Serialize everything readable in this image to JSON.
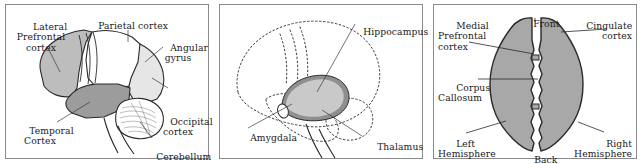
{
  "figure": {
    "panel_count": 3
  },
  "colors": {
    "background": "#ffffff",
    "frame_border": "#8a8a8a",
    "outline": "#1a1a1a",
    "text": "#1a1a1a",
    "fill_light": "#d8d8d8",
    "fill_medium": "#b9b9b9",
    "fill_dark": "#9a9a9a",
    "fill_pale": "#e6e6e6",
    "fill_white": "#ffffff",
    "hippocampus_band": "#8f8f8f",
    "hippocampus_fill": "#c9c9c9",
    "hemisphere_fill": "#a8a8a8"
  },
  "panels": [
    {
      "id": "lateral-view",
      "name": "Lateral brain view",
      "labels": [
        {
          "key": "lateral_prefrontal_cortex",
          "text": "Lateral\nPrefrontal\ncortex",
          "align": "center"
        },
        {
          "key": "parietal_cortex",
          "text": "Parietal cortex",
          "align": "center"
        },
        {
          "key": "angular_gyrus",
          "text": "Angular\ngyrus",
          "align": "center"
        },
        {
          "key": "temporal_cortex",
          "text": "Temporal\nCortex",
          "align": "center"
        },
        {
          "key": "occipital_cortex",
          "text": "Occipital\ncortex",
          "align": "center"
        },
        {
          "key": "cerebellum",
          "text": "Cerebellum",
          "align": "center"
        }
      ],
      "regions": [
        {
          "key": "lateral_prefrontal",
          "shade": "fill_medium"
        },
        {
          "key": "temporal",
          "shade": "fill_dark"
        },
        {
          "key": "occipital",
          "shade": "fill_pale"
        },
        {
          "key": "parietal",
          "shade": "fill_white"
        },
        {
          "key": "cerebellum",
          "shade": "fill_white"
        }
      ]
    },
    {
      "id": "limbic-view",
      "name": "Limbic structures view",
      "labels": [
        {
          "key": "hippocampus",
          "text": "Hippocampus",
          "align": "left"
        },
        {
          "key": "amygdala",
          "text": "Amygdala",
          "align": "left"
        },
        {
          "key": "thalamus",
          "text": "Thalamus",
          "align": "left"
        }
      ],
      "regions": [
        {
          "key": "hippocampus",
          "shade": "hippocampus_fill"
        },
        {
          "key": "amygdala",
          "shade": "fill_white"
        }
      ]
    },
    {
      "id": "superior-view",
      "name": "Superior (top down) brain view",
      "labels": [
        {
          "key": "medial_prefrontal_cortex",
          "text": "Medial\nPrefrontal\ncortex",
          "align": "left"
        },
        {
          "key": "front",
          "text": "Front",
          "align": "center"
        },
        {
          "key": "cingulate_cortex",
          "text": "Cingulate\ncortex",
          "align": "right"
        },
        {
          "key": "corpus_callosum",
          "text": "Corpus\nCallosum",
          "align": "left"
        },
        {
          "key": "left_hemisphere",
          "text": "Left\nHemisphere",
          "align": "left"
        },
        {
          "key": "back",
          "text": "Back",
          "align": "center"
        },
        {
          "key": "right_hemisphere",
          "text": "Right\nHemisphere",
          "align": "right"
        }
      ],
      "regions": [
        {
          "key": "left_hemisphere",
          "shade": "hemisphere_fill"
        },
        {
          "key": "right_hemisphere",
          "shade": "hemisphere_fill"
        }
      ]
    }
  ]
}
